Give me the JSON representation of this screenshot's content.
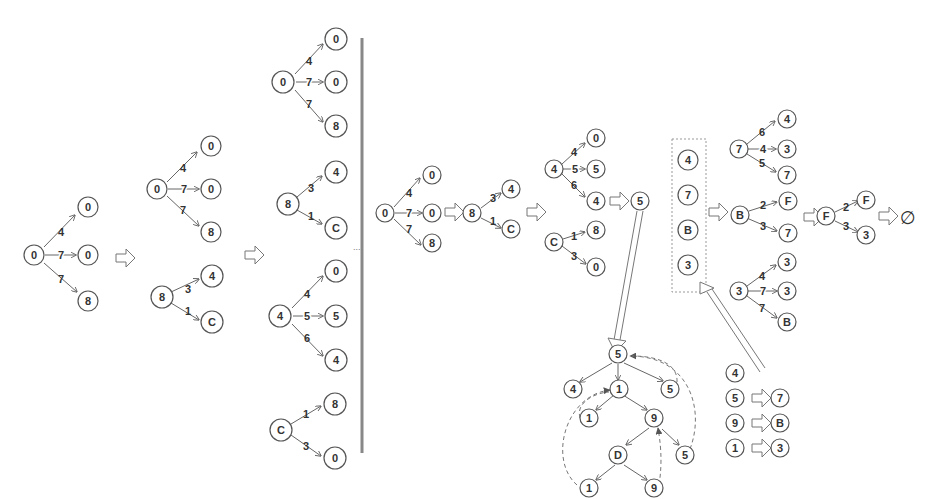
{
  "diagram": {
    "section1": {
      "step1_tree": {
        "root": "0",
        "edges": [
          {
            "label": "4",
            "to": "0"
          },
          {
            "label": "7",
            "to": "0"
          },
          {
            "label": "7",
            "to": "8"
          }
        ]
      },
      "step2_trees": [
        {
          "root": "0",
          "edges": [
            {
              "label": "4",
              "to": "0"
            },
            {
              "label": "7",
              "to": "0"
            },
            {
              "label": "7",
              "to": "8"
            }
          ]
        },
        {
          "root": "8",
          "edges": [
            {
              "label": "3",
              "to": "4"
            },
            {
              "label": "1",
              "to": "C"
            }
          ]
        }
      ],
      "step3_trees": [
        {
          "root": "0",
          "edges": [
            {
              "label": "4",
              "to": "0"
            },
            {
              "label": "7",
              "to": "0"
            },
            {
              "label": "7",
              "to": "8"
            }
          ]
        },
        {
          "root": "8",
          "edges": [
            {
              "label": "3",
              "to": "4"
            },
            {
              "label": "1",
              "to": "C"
            }
          ]
        },
        {
          "root": "4",
          "edges": [
            {
              "label": "4",
              "to": "0"
            },
            {
              "label": "5",
              "to": "5"
            },
            {
              "label": "6",
              "to": "4"
            }
          ]
        },
        {
          "root": "C",
          "edges": [
            {
              "label": "1",
              "to": "8"
            },
            {
              "label": "3",
              "to": "0"
            }
          ]
        }
      ],
      "ellipsis": "..."
    },
    "section2": {
      "chain": [
        {
          "root": "0",
          "edges": [
            {
              "label": "4",
              "to": "0"
            },
            {
              "label": "7",
              "to": "0"
            },
            {
              "label": "7",
              "to": "8"
            }
          ]
        },
        {
          "root": "8",
          "edges": [
            {
              "label": "3",
              "to": "4"
            },
            {
              "label": "1",
              "to": "C"
            }
          ]
        }
      ],
      "group": [
        {
          "root": "4",
          "edges": [
            {
              "label": "4",
              "to": "0"
            },
            {
              "label": "5",
              "to": "5"
            },
            {
              "label": "6",
              "to": "4"
            }
          ]
        },
        {
          "root": "C",
          "edges": [
            {
              "label": "1",
              "to": "8"
            },
            {
              "label": "3",
              "to": "0"
            }
          ]
        }
      ],
      "result_node": "5",
      "tree": {
        "root": "5",
        "level1": [
          "4",
          "1",
          "5"
        ],
        "level2": [
          "1",
          "9"
        ],
        "level3": [
          "D",
          "5"
        ],
        "level4": [
          "1",
          "9"
        ]
      },
      "state_box": [
        "4",
        "7",
        "B",
        "3"
      ],
      "mapping": [
        {
          "from": "4",
          "to": ""
        },
        {
          "from": "5",
          "to": "7"
        },
        {
          "from": "9",
          "to": "B"
        },
        {
          "from": "1",
          "to": "3"
        }
      ],
      "right_trees": [
        {
          "root": "7",
          "edges": [
            {
              "label": "6",
              "to": "4"
            },
            {
              "label": "4",
              "to": "3"
            },
            {
              "label": "5",
              "to": "7"
            }
          ]
        },
        {
          "root": "B",
          "edges": [
            {
              "label": "2",
              "to": "F"
            },
            {
              "label": "3",
              "to": "7"
            }
          ]
        },
        {
          "root": "3",
          "edges": [
            {
              "label": "4",
              "to": "3"
            },
            {
              "label": "7",
              "to": "3"
            },
            {
              "label": "7",
              "to": "B"
            }
          ]
        }
      ],
      "final_tree": {
        "root": "F",
        "edges": [
          {
            "label": "2",
            "to": "F"
          },
          {
            "label": "3",
            "to": "3"
          }
        ]
      },
      "end_symbol": "∅"
    }
  }
}
